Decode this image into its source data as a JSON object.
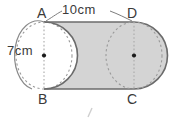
{
  "figure": {
    "kind": "geometry-diagram",
    "vertices": [
      {
        "name": "A",
        "label": "A",
        "position": "top-left"
      },
      {
        "name": "B",
        "label": "B",
        "position": "bottom-left"
      },
      {
        "name": "C",
        "label": "C",
        "position": "bottom-right"
      },
      {
        "name": "D",
        "label": "D",
        "position": "top-right"
      }
    ],
    "dimensions": [
      {
        "name": "length",
        "label": "10cm",
        "value": 10,
        "unit": "cm",
        "spans": "A to D"
      },
      {
        "name": "radius",
        "label": "7cm",
        "value": 7,
        "unit": "cm",
        "spans": "left circle centre to edge"
      }
    ],
    "colors": {
      "fill": "#d4d4d4",
      "stroke": "#6b6b6b",
      "dashed_stroke": "#9a9a9a",
      "text": "#3a3a3a",
      "background": "#ffffff"
    },
    "center_dots": [
      {
        "name": "left-circle-center"
      },
      {
        "name": "right-circle-center"
      }
    ],
    "footer_mark": "/"
  }
}
